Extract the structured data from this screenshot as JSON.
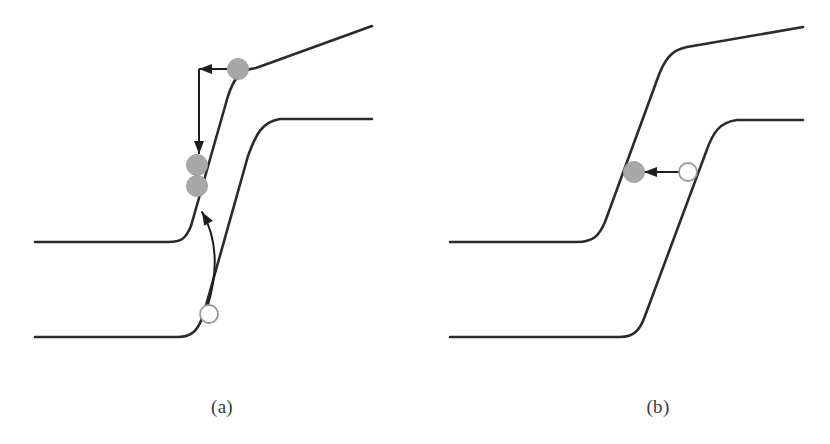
{
  "figure": {
    "type": "band-diagram",
    "background_color": "#ffffff",
    "band_line_color": "#2b2b2b",
    "band_line_width": 2.6,
    "electron_fill_color": "#a8a8a8",
    "electron_stroke_color": "#a0a0a0",
    "hole_fill_color": "#ffffff",
    "hole_stroke_color": "#9a9a9a",
    "arrow_color": "#1e1e1e"
  },
  "panels": [
    {
      "id": "a",
      "caption": "(a)",
      "bands": [
        {
          "name": "conduction-band",
          "role": "upper band",
          "left_plateau_y": 242,
          "right_plateau_y": 26,
          "left_plateau_x_start": 35,
          "right_plateau_x_end": 372,
          "knee_low_x": 178,
          "knee_high_x": 253,
          "path": "M 35 242 L 168 242 C 182 242 186 238 191 226 L 228 96 C 234 78 240 70 256 68 L 372 26"
        },
        {
          "name": "valence-band",
          "role": "lower band",
          "left_plateau_y": 337,
          "right_plateau_y": 119,
          "left_plateau_x_start": 35,
          "right_plateau_x_end": 372,
          "knee_low_x": 190,
          "knee_high_x": 272,
          "path": "M 35 337 L 178 337 C 192 337 198 330 203 316 L 248 156 C 256 134 262 122 280 119 L 372 119"
        }
      ],
      "particles": [
        {
          "name": "electron-hot",
          "kind": "electron",
          "cx": 238,
          "cy": 69,
          "r": 10.5,
          "filled": true
        },
        {
          "name": "electron-relaxed-upper",
          "kind": "electron",
          "cx": 197,
          "cy": 165,
          "r": 10.5,
          "filled": true
        },
        {
          "name": "electron-relaxed-lower",
          "kind": "electron",
          "cx": 197,
          "cy": 186,
          "r": 10.5,
          "filled": true
        },
        {
          "name": "hole",
          "kind": "hole",
          "cx": 209,
          "cy": 314,
          "r": 9,
          "filled": false
        }
      ],
      "arrows": [
        {
          "name": "thermalization-horizontal-arrow",
          "kind": "straight",
          "from": {
            "x": 232,
            "y": 69
          },
          "to": {
            "x": 199,
            "y": 69
          },
          "head_at": "to",
          "direction": "left"
        },
        {
          "name": "thermalization-vertical-arrow",
          "kind": "straight",
          "from": {
            "x": 199,
            "y": 69
          },
          "to": {
            "x": 199,
            "y": 154
          },
          "head_at": "to",
          "direction": "down"
        },
        {
          "name": "hole-transport-curved-arrow",
          "kind": "curved",
          "from": {
            "x": 208,
            "y": 305
          },
          "to": {
            "x": 202,
            "y": 212
          },
          "control": {
            "x": 224,
            "y": 250
          },
          "head_at": "to",
          "direction": "up"
        }
      ]
    },
    {
      "id": "b",
      "caption": "(b)",
      "bands": [
        {
          "name": "conduction-band",
          "role": "upper band",
          "left_plateau_y": 242,
          "right_plateau_y": 27,
          "left_plateau_x_start": 35,
          "right_plateau_x_end": 388,
          "knee_low_x": 175,
          "knee_high_x": 268,
          "path": "M 35 242 L 162 242 C 178 242 184 236 190 222 L 242 80 C 249 60 256 50 272 47 L 388 27"
        },
        {
          "name": "valence-band",
          "role": "lower band",
          "left_plateau_y": 337,
          "right_plateau_y": 120,
          "left_plateau_x_start": 35,
          "right_plateau_x_end": 388,
          "knee_low_x": 212,
          "knee_high_x": 318,
          "path": "M 35 337 L 205 337 C 219 337 225 330 230 316 L 291 152 C 298 132 305 122 322 120 L 388 120"
        }
      ],
      "particles": [
        {
          "name": "electron",
          "kind": "electron",
          "cx": 219,
          "cy": 172,
          "r": 10.5,
          "filled": true
        },
        {
          "name": "hole",
          "kind": "hole",
          "cx": 273,
          "cy": 172,
          "r": 9,
          "filled": false
        }
      ],
      "arrows": [
        {
          "name": "recombination-arrow",
          "kind": "straight",
          "from": {
            "x": 266,
            "y": 172
          },
          "to": {
            "x": 229,
            "y": 172
          },
          "head_at": "to",
          "direction": "left"
        }
      ]
    }
  ]
}
